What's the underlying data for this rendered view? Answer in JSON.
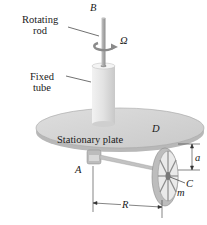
{
  "labels": {
    "rotating_rod": [
      "Rotating",
      "rod"
    ],
    "fixed_tube": [
      "Fixed",
      "tube"
    ],
    "stationary_plate": "Stationary plate",
    "point_B": "B",
    "point_D": "D",
    "point_A": "A",
    "point_C": "C",
    "mass_m": "m",
    "angular_velocity": "Ω",
    "dim_a": "a",
    "dim_R": "R"
  },
  "colors": {
    "plate_top": "#d6d6d6",
    "plate_edge": "#b5b5b5",
    "tube": "#e0e0e0",
    "rod": "#a8a8a8",
    "wheel": "#bdbdbd",
    "line": "#333333",
    "arrow": "#8a8a8a"
  }
}
